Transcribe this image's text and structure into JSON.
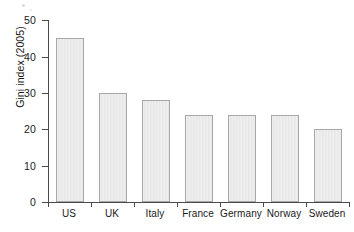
{
  "chart_data": {
    "type": "bar",
    "title": "",
    "subtitle": "",
    "xlabel": "",
    "ylabel": "Gini index (2005)",
    "categories": [
      "US",
      "UK",
      "Italy",
      "France",
      "Germany",
      "Norway",
      "Sweden"
    ],
    "values": [
      45,
      30,
      28,
      24,
      24,
      24,
      20
    ],
    "series": [
      {
        "name": "Gini index (2005)",
        "values": [
          45,
          30,
          28,
          24,
          24,
          24,
          20
        ]
      }
    ],
    "ylim": [
      0,
      50
    ],
    "y_ticks": [
      0,
      10,
      20,
      30,
      40,
      50
    ],
    "y_tick_labels": [
      "0",
      "10",
      "20",
      "30",
      "40",
      "50"
    ],
    "grid": false,
    "legend": false,
    "legend_position": "none",
    "bar_fill_color": "#e9e9e9",
    "bar_edge_color": "#a8a8a8",
    "axis_color": "#4a4a4a",
    "background_color": "#ffffff",
    "annotations": []
  },
  "axis": {
    "y_title": "Gini index (2005)",
    "tick_0": "0",
    "tick_10": "10",
    "tick_20": "20",
    "tick_30": "30",
    "tick_40": "40",
    "tick_50": "50"
  },
  "categories": {
    "c0": "US",
    "c1": "UK",
    "c2": "Italy",
    "c3": "France",
    "c4": "Germany",
    "c5": "Norway",
    "c6": "Sweden"
  }
}
